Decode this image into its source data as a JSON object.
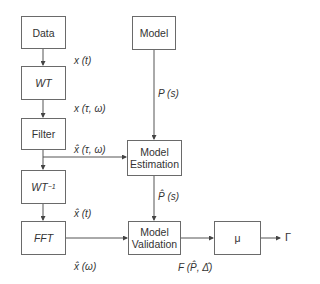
{
  "diagram": {
    "nodes": [
      {
        "id": "data",
        "label": "Data"
      },
      {
        "id": "wt",
        "label": "WT"
      },
      {
        "id": "filter",
        "label": "Filter"
      },
      {
        "id": "iwt",
        "label": "WT",
        "sup": "−1"
      },
      {
        "id": "fft",
        "label": "FFT"
      },
      {
        "id": "model",
        "label": "Model"
      },
      {
        "id": "estimation",
        "label_line1": "Model",
        "label_line2": "Estimation"
      },
      {
        "id": "validation",
        "label_line1": "Model",
        "label_line2": "Validation"
      },
      {
        "id": "mu",
        "label": "μ"
      }
    ],
    "edge_labels": {
      "data_wt": "x (t)",
      "wt_filter": "x (τ, ω)",
      "filter_estimation": "x̂ (τ, ω)",
      "iwt_fft": "x̂ (t)",
      "fft_out": "x̂ (ω)",
      "model_estimation": "P (s)",
      "estimation_validation": "P̂ (s)",
      "validation_out": "F (P̂, Δ̂)",
      "output": "Γ"
    },
    "edges": [
      [
        "data",
        "wt"
      ],
      [
        "wt",
        "filter"
      ],
      [
        "filter",
        "iwt"
      ],
      [
        "filter",
        "estimation"
      ],
      [
        "iwt",
        "fft"
      ],
      [
        "fft",
        "validation"
      ],
      [
        "model",
        "estimation"
      ],
      [
        "estimation",
        "validation"
      ],
      [
        "validation",
        "mu"
      ],
      [
        "mu",
        "output"
      ]
    ]
  }
}
